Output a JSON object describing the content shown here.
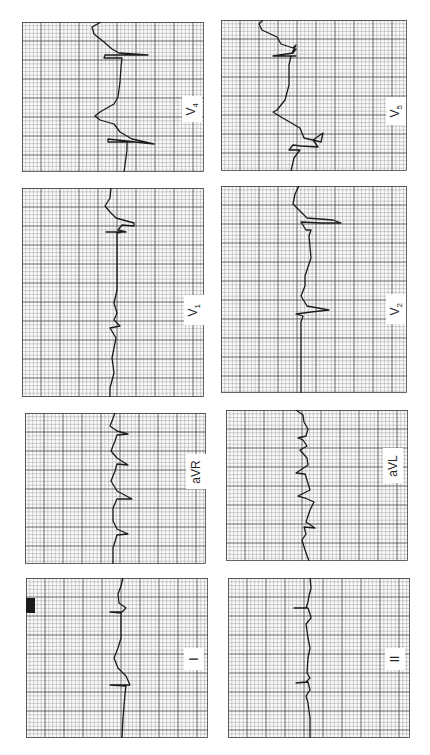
{
  "figure": {
    "grid": {
      "minor_px": 3.8,
      "major_px": 19,
      "minor_color": "#9a9a9a",
      "major_color": "#444444",
      "paper_color": "#fafafa",
      "trace_color": "#1a1a1a"
    }
  },
  "panels": [
    {
      "id": "V4",
      "label": "V",
      "sub": "4",
      "x": 22,
      "y": 22,
      "w": 182,
      "h": 150,
      "label_box": {
        "x": 160,
        "y": 74,
        "w": 20,
        "h": 26
      },
      "trace": [
        [
          79,
          0
        ],
        [
          70,
          5
        ],
        [
          72,
          12
        ],
        [
          82,
          20
        ],
        [
          90,
          27
        ],
        [
          97,
          31
        ],
        [
          126,
          33
        ],
        [
          83,
          33
        ],
        [
          82,
          36
        ],
        [
          100,
          36
        ],
        [
          99,
          45
        ],
        [
          98,
          60
        ],
        [
          96,
          75
        ],
        [
          92,
          82
        ],
        [
          78,
          90
        ],
        [
          73,
          94
        ],
        [
          78,
          98
        ],
        [
          92,
          102
        ],
        [
          98,
          110
        ],
        [
          110,
          117
        ],
        [
          132,
          122
        ],
        [
          86,
          117
        ],
        [
          86,
          120
        ],
        [
          113,
          120
        ],
        [
          105,
          120
        ],
        [
          105,
          128
        ],
        [
          102,
          150
        ]
      ]
    },
    {
      "id": "V5",
      "label": "V",
      "sub": "5",
      "x": 221,
      "y": 20,
      "w": 186,
      "h": 151,
      "label_box": {
        "x": 165,
        "y": 77,
        "w": 20,
        "h": 28
      },
      "trace": [
        [
          42,
          0
        ],
        [
          38,
          4
        ],
        [
          41,
          10
        ],
        [
          56,
          17
        ],
        [
          60,
          24
        ],
        [
          72,
          28
        ],
        [
          75,
          25
        ],
        [
          71,
          33
        ],
        [
          75,
          29
        ],
        [
          72,
          33
        ],
        [
          52,
          36
        ],
        [
          75,
          36
        ],
        [
          70,
          36
        ],
        [
          68,
          45
        ],
        [
          68,
          65
        ],
        [
          64,
          80
        ],
        [
          56,
          90
        ],
        [
          52,
          92
        ],
        [
          60,
          97
        ],
        [
          79,
          108
        ],
        [
          83,
          118
        ],
        [
          100,
          122
        ],
        [
          102,
          113
        ],
        [
          92,
          120
        ],
        [
          97,
          127
        ],
        [
          80,
          126
        ],
        [
          72,
          125
        ],
        [
          68,
          130
        ],
        [
          79,
          130
        ],
        [
          73,
          138
        ],
        [
          70,
          151
        ]
      ]
    },
    {
      "id": "V1",
      "label": "V",
      "sub": "1",
      "x": 22,
      "y": 188,
      "w": 182,
      "h": 209,
      "label_box": {
        "x": 162,
        "y": 107,
        "w": 20,
        "h": 30
      },
      "trace": [
        [
          89,
          0
        ],
        [
          88,
          10
        ],
        [
          83,
          18
        ],
        [
          88,
          24
        ],
        [
          94,
          30
        ],
        [
          112,
          35
        ],
        [
          112,
          38
        ],
        [
          100,
          37
        ],
        [
          96,
          42
        ],
        [
          104,
          44
        ],
        [
          84,
          44
        ],
        [
          100,
          44
        ],
        [
          95,
          45
        ],
        [
          95,
          60
        ],
        [
          95,
          80
        ],
        [
          95,
          102
        ],
        [
          92,
          115
        ],
        [
          95,
          125
        ],
        [
          92,
          132
        ],
        [
          98,
          138
        ],
        [
          88,
          140
        ],
        [
          94,
          150
        ],
        [
          90,
          170
        ],
        [
          92,
          185
        ],
        [
          88,
          200
        ],
        [
          88,
          209
        ]
      ]
    },
    {
      "id": "V2",
      "label": "V",
      "sub": "2",
      "x": 221,
      "y": 186,
      "w": 186,
      "h": 207,
      "label_box": {
        "x": 165,
        "y": 108,
        "w": 20,
        "h": 30
      },
      "trace": [
        [
          78,
          0
        ],
        [
          74,
          8
        ],
        [
          72,
          18
        ],
        [
          80,
          26
        ],
        [
          86,
          32
        ],
        [
          112,
          34
        ],
        [
          120,
          37
        ],
        [
          100,
          37
        ],
        [
          80,
          36
        ],
        [
          85,
          44
        ],
        [
          90,
          44
        ],
        [
          88,
          50
        ],
        [
          90,
          72
        ],
        [
          84,
          90
        ],
        [
          84,
          100
        ],
        [
          80,
          110
        ],
        [
          86,
          120
        ],
        [
          108,
          124
        ],
        [
          90,
          126
        ],
        [
          75,
          128
        ],
        [
          82,
          130
        ],
        [
          80,
          136
        ],
        [
          80,
          142
        ],
        [
          80,
          155
        ],
        [
          80,
          175
        ],
        [
          80,
          195
        ],
        [
          80,
          207
        ]
      ]
    },
    {
      "id": "aVR",
      "label": "aVR",
      "sub": "",
      "x": 25,
      "y": 413,
      "w": 181,
      "h": 151,
      "label_box": {
        "x": 161,
        "y": 41,
        "w": 20,
        "h": 35
      },
      "trace": [
        [
          90,
          0
        ],
        [
          87,
          8
        ],
        [
          85,
          13
        ],
        [
          92,
          18
        ],
        [
          103,
          21
        ],
        [
          92,
          22
        ],
        [
          90,
          28
        ],
        [
          86,
          38
        ],
        [
          92,
          45
        ],
        [
          103,
          52
        ],
        [
          92,
          51
        ],
        [
          90,
          58
        ],
        [
          86,
          68
        ],
        [
          92,
          78
        ],
        [
          107,
          86
        ],
        [
          92,
          86
        ],
        [
          88,
          95
        ],
        [
          88,
          108
        ],
        [
          92,
          116
        ],
        [
          103,
          121
        ],
        [
          92,
          122
        ],
        [
          88,
          135
        ],
        [
          88,
          151
        ]
      ]
    },
    {
      "id": "aVL",
      "label": "aVL",
      "sub": "",
      "x": 226,
      "y": 410,
      "w": 182,
      "h": 151,
      "label_box": {
        "x": 157,
        "y": 38,
        "w": 20,
        "h": 35
      },
      "trace": [
        [
          70,
          0
        ],
        [
          77,
          5
        ],
        [
          78,
          12
        ],
        [
          82,
          19
        ],
        [
          80,
          26
        ],
        [
          72,
          28
        ],
        [
          77,
          30
        ],
        [
          81,
          36
        ],
        [
          74,
          40
        ],
        [
          81,
          48
        ],
        [
          82,
          55
        ],
        [
          70,
          63
        ],
        [
          79,
          64
        ],
        [
          81,
          70
        ],
        [
          84,
          80
        ],
        [
          72,
          86
        ],
        [
          79,
          88
        ],
        [
          88,
          92
        ],
        [
          84,
          100
        ],
        [
          80,
          112
        ],
        [
          89,
          118
        ],
        [
          78,
          117
        ],
        [
          80,
          124
        ],
        [
          76,
          130
        ],
        [
          79,
          140
        ],
        [
          83,
          151
        ]
      ]
    },
    {
      "id": "I",
      "label": "I",
      "sub": "",
      "x": 26,
      "y": 578,
      "w": 182,
      "h": 160,
      "label_box": {
        "x": 158,
        "y": 70,
        "w": 20,
        "h": 22
      },
      "trace": [
        [
          97,
          0
        ],
        [
          95,
          8
        ],
        [
          92,
          16
        ],
        [
          93,
          25
        ],
        [
          100,
          30
        ],
        [
          95,
          35
        ],
        [
          84,
          34
        ],
        [
          95,
          34
        ],
        [
          95,
          45
        ],
        [
          95,
          60
        ],
        [
          92,
          70
        ],
        [
          88,
          80
        ],
        [
          92,
          90
        ],
        [
          100,
          98
        ],
        [
          104,
          107
        ],
        [
          84,
          107
        ],
        [
          100,
          108
        ],
        [
          99,
          116
        ],
        [
          97,
          140
        ],
        [
          96,
          160
        ]
      ]
    },
    {
      "id": "II",
      "label": "II",
      "sub": "",
      "x": 228,
      "y": 578,
      "w": 182,
      "h": 160,
      "label_box": {
        "x": 157,
        "y": 70,
        "w": 20,
        "h": 22
      },
      "trace": [
        [
          82,
          0
        ],
        [
          83,
          10
        ],
        [
          81,
          18
        ],
        [
          80,
          24
        ],
        [
          78,
          30
        ],
        [
          66,
          30
        ],
        [
          80,
          30
        ],
        [
          82,
          36
        ],
        [
          83,
          40
        ],
        [
          78,
          46
        ],
        [
          80,
          60
        ],
        [
          82,
          70
        ],
        [
          80,
          80
        ],
        [
          79,
          95
        ],
        [
          82,
          100
        ],
        [
          78,
          104
        ],
        [
          68,
          105
        ],
        [
          80,
          104
        ],
        [
          82,
          112
        ],
        [
          78,
          118
        ],
        [
          80,
          125
        ],
        [
          82,
          140
        ],
        [
          82,
          160
        ]
      ]
    }
  ],
  "calibration_mark": {
    "panel": "I",
    "x": 0,
    "y": 20,
    "w": 9,
    "h": 15,
    "color": "#1a1a1a"
  },
  "labels": {
    "V4": "V4",
    "V5": "V5",
    "V1": "V1",
    "V2": "V2",
    "aVR": "aVR",
    "aVL": "aVL",
    "I": "I",
    "II": "II"
  }
}
